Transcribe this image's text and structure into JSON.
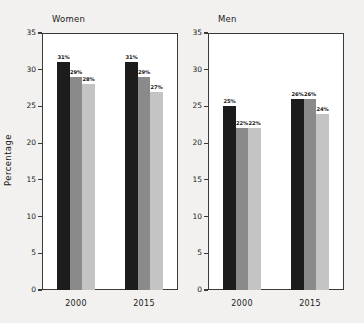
{
  "figure": {
    "background_color": "#f2f1ef",
    "plot_background_color": "#ffffff",
    "axis_color": "#3a3a3a",
    "ylabel": "Percentage"
  },
  "chart_data": {
    "type": "bar",
    "title": "",
    "xlabel": "",
    "ylabel": "Percentage",
    "ylim": [
      0,
      35
    ],
    "yticks": [
      0,
      5,
      10,
      15,
      20,
      25,
      30,
      35
    ],
    "ytick_labels": [
      "0",
      "5",
      "10",
      "15",
      "20",
      "25",
      "30",
      "35"
    ],
    "grid": false,
    "legend_position": "none",
    "categories": [
      "2000",
      "2015"
    ],
    "panels": [
      {
        "title": "Women",
        "series": [
          {
            "name": "series-1",
            "color": "#1c1c1c",
            "values": [
              31,
              31
            ],
            "labels": [
              "31%",
              "31%"
            ]
          },
          {
            "name": "series-2",
            "color": "#8a8a8a",
            "values": [
              29,
              29
            ],
            "labels": [
              "29%",
              "29%"
            ]
          },
          {
            "name": "series-3",
            "color": "#c4c4c4",
            "values": [
              28,
              27
            ],
            "labels": [
              "28%",
              "27%"
            ]
          }
        ]
      },
      {
        "title": "Men",
        "series": [
          {
            "name": "series-1",
            "color": "#1c1c1c",
            "values": [
              25,
              26
            ],
            "labels": [
              "25%",
              "26%"
            ]
          },
          {
            "name": "series-2",
            "color": "#8a8a8a",
            "values": [
              22,
              26
            ],
            "labels": [
              "22%",
              "26%"
            ]
          },
          {
            "name": "series-3",
            "color": "#c4c4c4",
            "values": [
              22,
              24
            ],
            "labels": [
              "22%",
              "24%"
            ]
          }
        ]
      }
    ]
  }
}
